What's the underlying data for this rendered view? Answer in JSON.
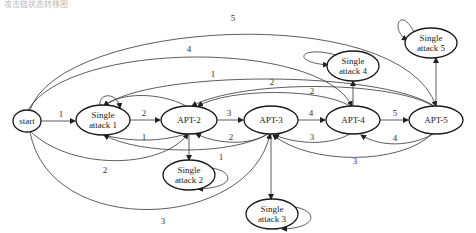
{
  "caption": "攻击链状态转移图",
  "nodes": [
    {
      "id": "start",
      "lines": [
        "start"
      ],
      "cx": 27,
      "cy": 121,
      "rx": 14,
      "ry": 11
    },
    {
      "id": "sa1",
      "lines": [
        "Single",
        "attack 1"
      ],
      "cx": 103,
      "cy": 120,
      "rx": 27,
      "ry": 15
    },
    {
      "id": "apt2",
      "lines": [
        "APT-2"
      ],
      "cx": 189,
      "cy": 120,
      "rx": 28,
      "ry": 14
    },
    {
      "id": "apt3",
      "lines": [
        "APT-3"
      ],
      "cx": 271,
      "cy": 120,
      "rx": 27,
      "ry": 14
    },
    {
      "id": "apt4",
      "lines": [
        "APT-4"
      ],
      "cx": 353,
      "cy": 120,
      "rx": 27,
      "ry": 14
    },
    {
      "id": "apt5",
      "lines": [
        "APT-5"
      ],
      "cx": 436,
      "cy": 120,
      "rx": 27,
      "ry": 14
    },
    {
      "id": "sa2",
      "lines": [
        "Single",
        "attack 2"
      ],
      "cx": 189,
      "cy": 175,
      "rx": 26,
      "ry": 15
    },
    {
      "id": "sa3",
      "lines": [
        "Single",
        "attack 3"
      ],
      "cx": 272,
      "cy": 214,
      "rx": 26,
      "ry": 15
    },
    {
      "id": "sa4",
      "lines": [
        "Single",
        "attack 4"
      ],
      "cx": 353,
      "cy": 66,
      "rx": 26,
      "ry": 15
    },
    {
      "id": "sa5",
      "lines": [
        "Single",
        "attack 5"
      ],
      "cx": 431,
      "cy": 43,
      "rx": 26,
      "ry": 15
    }
  ],
  "edges": [
    {
      "from": "start",
      "to": "sa1",
      "label": "1",
      "d": "M41,121 L75,121",
      "lx": 61,
      "ly": 117
    },
    {
      "from": "sa1",
      "to": "apt2",
      "label": "2",
      "d": "M130,120 L160,120",
      "lx": 144,
      "ly": 116
    },
    {
      "from": "apt2",
      "to": "apt3",
      "label": "3",
      "d": "M217,120 L243,120",
      "lx": 229,
      "ly": 116
    },
    {
      "from": "apt3",
      "to": "apt4",
      "label": "4",
      "d": "M298,120 L325,120",
      "lx": 311,
      "ly": 116
    },
    {
      "from": "apt4",
      "to": "apt5",
      "label": "5",
      "d": "M380,120 L408,120",
      "lx": 395,
      "ly": 116
    },
    {
      "from": "start",
      "to": "apt5",
      "label": "5",
      "d": "M30,110 C60,20 400,0 436,106",
      "lx": 233,
      "ly": 21
    },
    {
      "from": "start",
      "to": "apt4",
      "label": "4",
      "d": "M28,110 C70,40 320,40 352,106",
      "lx": 189,
      "ly": 52
    },
    {
      "from": "apt5",
      "to": "sa1",
      "label": "1",
      "d": "M434,106 C380,70 150,70 104,106",
      "lx": 213,
      "ly": 77
    },
    {
      "from": "apt5",
      "to": "apt2",
      "label": "2",
      "d": "M433,106 C390,80 240,80 192,106",
      "lx": 272,
      "ly": 85
    },
    {
      "from": "apt4",
      "to": "apt2",
      "label": "2",
      "d": "M350,106 C320,88 230,88 198,106",
      "lx": 312,
      "ly": 94
    },
    {
      "from": "apt2",
      "to": "sa1",
      "label": "",
      "d": "M186,106 C160,92 120,92 104,106",
      "lx": 0,
      "ly": 0
    },
    {
      "from": "sa1",
      "to": "sa1",
      "label": "",
      "d": "M100,106 C98,92 118,92 120,108",
      "lx": 0,
      "ly": 0
    },
    {
      "from": "apt2",
      "to": "sa1",
      "label": "1",
      "d": "M186,134 C160,142 130,142 104,135",
      "lx": 144,
      "ly": 140
    },
    {
      "from": "apt3",
      "to": "apt2",
      "label": "2",
      "d": "M268,134 C250,145 220,145 196,134",
      "lx": 231,
      "ly": 140
    },
    {
      "from": "apt3",
      "to": "sa1",
      "label": "1",
      "d": "M266,135 C230,155 140,155 104,135",
      "lx": 221,
      "ly": 160
    },
    {
      "from": "start",
      "to": "apt2",
      "label": "2",
      "d": "M30,131 C70,170 160,170 188,134",
      "lx": 105,
      "ly": 173
    },
    {
      "from": "start",
      "to": "apt3",
      "label": "3",
      "d": "M30,132 C50,240 250,230 270,134",
      "lx": 163,
      "ly": 224
    },
    {
      "from": "apt4",
      "to": "apt3",
      "label": "3",
      "d": "M350,134 C330,145 300,145 274,135",
      "lx": 312,
      "ly": 140
    },
    {
      "from": "apt5",
      "to": "apt4",
      "label": "4",
      "d": "M433,134 C410,147 380,147 361,135",
      "lx": 395,
      "ly": 141
    },
    {
      "from": "apt5",
      "to": "apt3",
      "label": "3",
      "d": "M432,134 C400,165 310,165 273,135",
      "lx": 355,
      "ly": 164
    },
    {
      "from": "apt2",
      "to": "sa2",
      "label": "",
      "d": "M189,134 L189,160",
      "lx": 0,
      "ly": 0
    },
    {
      "from": "apt3",
      "to": "sa3",
      "label": "",
      "d": "M271,134 L271,199",
      "lx": 0,
      "ly": 0
    },
    {
      "from": "apt4",
      "to": "sa4",
      "label": "",
      "d": "M353,106 L353,81",
      "lx": 0,
      "ly": 0
    },
    {
      "from": "apt5",
      "to": "sa5",
      "label": "",
      "d": "M436,106 L436,58",
      "lx": 0,
      "ly": 0
    },
    {
      "from": "sa2",
      "to": "sa2",
      "label": "",
      "d": "M212,168 C235,172 235,188 198,189",
      "lx": 0,
      "ly": 0
    },
    {
      "from": "sa3",
      "to": "sa3",
      "label": "",
      "d": "M295,207 C318,211 318,228 282,229",
      "lx": 0,
      "ly": 0
    },
    {
      "from": "sa4",
      "to": "sa4",
      "label": "",
      "d": "M336,55 C300,45 290,62 328,65",
      "lx": 0,
      "ly": 0
    },
    {
      "from": "sa5",
      "to": "sa5",
      "label": "",
      "d": "M414,32 C400,5 390,30 407,40",
      "lx": 0,
      "ly": 0
    }
  ]
}
